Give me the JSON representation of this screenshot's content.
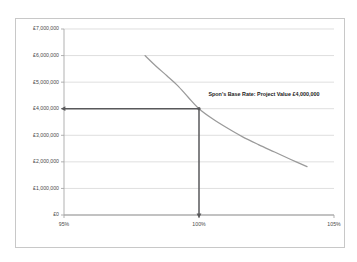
{
  "chart_data": {
    "type": "line",
    "title": "",
    "xlabel": "",
    "ylabel": "",
    "xlim": [
      95,
      105
    ],
    "ylim": [
      0,
      7000000
    ],
    "grid": true,
    "legend": "none",
    "x_tick_labels": [
      "95%",
      "100%",
      "105%"
    ],
    "x_tick_values": [
      95,
      100,
      105
    ],
    "y_tick_labels": [
      "£7,000,000",
      "£6,000,000",
      "£5,000,000",
      "£4,000,000",
      "£3,000,000",
      "£2,000,000",
      "£1,000,000",
      "£0"
    ],
    "y_tick_values": [
      7000000,
      6000000,
      5000000,
      4000000,
      3000000,
      2000000,
      1000000,
      0
    ],
    "series": [
      {
        "name": "Project Value Curve",
        "color": "#9a9a9a",
        "x": [
          98.0,
          98.4,
          98.8,
          99.2,
          99.6,
          100.0,
          100.5,
          101.0,
          101.6,
          102.2,
          102.8,
          103.4,
          104.0
        ],
        "values": [
          6000000,
          5610000,
          5250000,
          4880000,
          4430000,
          4000000,
          3620000,
          3300000,
          2950000,
          2650000,
          2370000,
          2090000,
          1820000
        ]
      }
    ],
    "annotations": [
      {
        "name": "base-rate-callout",
        "text": "Spon's Base Rate: Project Value £4,000,000",
        "x": 100.35,
        "y": 4550000
      }
    ],
    "indicators": [
      {
        "name": "value-guide-horizontal",
        "orientation": "horizontal",
        "from_x": 95,
        "to_x": 100,
        "y": 4000000,
        "arrow_at": "start",
        "color": "#59595b"
      },
      {
        "name": "value-guide-vertical",
        "orientation": "vertical",
        "x": 100,
        "from_y": 4000000,
        "to_y": 0,
        "arrow_at": "end",
        "color": "#59595b"
      }
    ],
    "intersection_point": {
      "x": 100,
      "y": 4000000,
      "x_label": "100%",
      "y_label": "£4,000,000"
    }
  }
}
